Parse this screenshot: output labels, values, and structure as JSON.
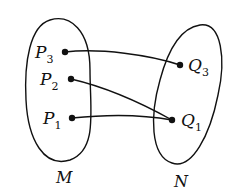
{
  "diagram": {
    "type": "set-mapping",
    "sets": [
      {
        "id": "M",
        "label": "M",
        "elements": [
          "P3",
          "P2",
          "P1"
        ]
      },
      {
        "id": "N",
        "label": "N",
        "elements": [
          "Q3",
          "Q1"
        ]
      }
    ],
    "points": {
      "P3": {
        "base": "P",
        "sub": "3"
      },
      "P2": {
        "base": "P",
        "sub": "2"
      },
      "P1": {
        "base": "P",
        "sub": "1"
      },
      "Q3": {
        "base": "Q",
        "sub": "3"
      },
      "Q1": {
        "base": "Q",
        "sub": "1"
      }
    },
    "edges": [
      {
        "from": "P3",
        "to": "Q3"
      },
      {
        "from": "P2",
        "to": "Q1"
      },
      {
        "from": "P1",
        "to": "Q1"
      }
    ],
    "colors": {
      "stroke": "#111111",
      "background": "#ffffff"
    }
  }
}
